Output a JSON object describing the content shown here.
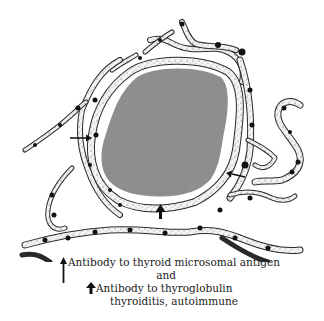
{
  "figure": {
    "colors": {
      "colloid": "#8e8e8e",
      "cell_outline": "#2a2a2a",
      "cell_fill": "#f4f4f4",
      "nucleus": "#111111",
      "arrow": "#111111",
      "background": "#ffffff"
    },
    "arrows": [
      {
        "type": "thin-arrow",
        "meaning": "microsomal-antigen",
        "position": "left-of-follicle"
      },
      {
        "type": "thin-arrow",
        "meaning": "microsomal-antigen",
        "position": "right-of-follicle"
      },
      {
        "type": "bold-arrow",
        "meaning": "thyroglobulin",
        "position": "below-colloid"
      }
    ]
  },
  "caption": {
    "line1": "Antibody to thyroid microsomal antigen",
    "connector": "and",
    "line2": "Antibody to thyroglobulin",
    "line3": "thyroiditis, autoimmune"
  },
  "legend": {
    "thin_arrow_icon": "long-up-arrow-icon",
    "bold_arrow_icon": "bold-up-arrow-icon"
  }
}
